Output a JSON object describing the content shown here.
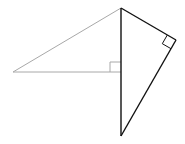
{
  "diagram": {
    "type": "geometry",
    "colors": {
      "gray_line": "#a8a8a8",
      "black_line": "#111111",
      "background": "#ffffff"
    },
    "points": {
      "top": [
        121,
        8
      ],
      "left": [
        13,
        72
      ],
      "foot": [
        121,
        72
      ],
      "right": [
        176,
        40
      ],
      "bottom": [
        121,
        136
      ]
    },
    "segments": [
      {
        "name": "left-hypotenuse",
        "from": "left",
        "to": "top",
        "color": "gray"
      },
      {
        "name": "left-base",
        "from": "left",
        "to": "foot",
        "color": "gray"
      },
      {
        "name": "vertical-side",
        "from": "top",
        "to": "bottom",
        "color": "black"
      },
      {
        "name": "upper-right-side",
        "from": "top",
        "to": "right",
        "color": "black"
      },
      {
        "name": "lower-right-side",
        "from": "right",
        "to": "bottom",
        "color": "black"
      }
    ],
    "right_angle_marks": [
      {
        "at": "foot",
        "color": "gray"
      },
      {
        "at": "right",
        "color": "black"
      }
    ]
  }
}
